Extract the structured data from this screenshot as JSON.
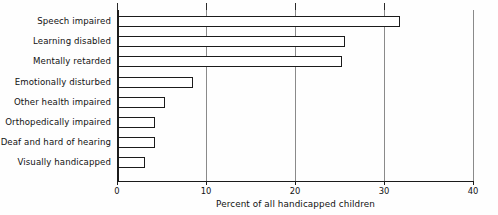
{
  "chart_data": {
    "type": "bar",
    "orientation": "horizontal",
    "title": "",
    "xlabel": "Percent of all handicapped children",
    "ylabel": "",
    "xlim": [
      0,
      40
    ],
    "xticks": [
      0,
      10,
      20,
      30,
      40
    ],
    "xtick_labels": [
      "0",
      "10",
      "20",
      "30",
      "40"
    ],
    "grid": true,
    "grid_axis": "x",
    "legend": false,
    "categories": [
      "Speech impaired",
      "Learning disabled",
      "Mentally retarded",
      "Emotionally disturbed",
      "Other health impaired",
      "Orthopedically impaired",
      "Deaf and hard of hearing",
      "Visually handicapped"
    ],
    "values": [
      31.8,
      25.6,
      25.3,
      8.5,
      5.4,
      4.3,
      4.3,
      3.2
    ],
    "bar_face_color": "#ffffff",
    "bar_edge_color": "#1b1b1b",
    "grid_color": "#8a8a8a",
    "axis_color": "#1b1b1b",
    "background_color": "#fefefe"
  }
}
